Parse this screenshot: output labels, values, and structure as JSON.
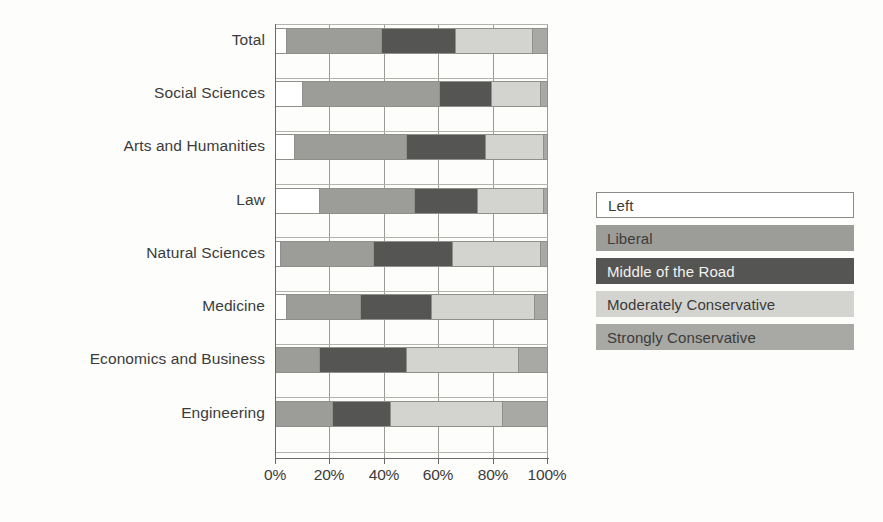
{
  "chart_data": {
    "type": "bar",
    "orientation": "horizontal",
    "stacked": true,
    "normalized": true,
    "title": "",
    "xlabel": "",
    "ylabel": "",
    "xlim": [
      0,
      100
    ],
    "xticks": [
      "0%",
      "20%",
      "40%",
      "60%",
      "80%",
      "100%"
    ],
    "xtick_values": [
      0,
      20,
      40,
      60,
      80,
      100
    ],
    "grid": true,
    "legend_position": "right",
    "categories": [
      "Total",
      "Social Sciences",
      "Arts and Humanities",
      "Law",
      "Natural Sciences",
      "Medicine",
      "Economics and Business",
      "Engineering"
    ],
    "series": [
      {
        "name": "Left",
        "color": "#ffffff",
        "values": [
          4,
          10,
          7,
          16,
          2,
          4,
          0,
          0
        ]
      },
      {
        "name": "Liberal",
        "color": "#9c9c99",
        "values": [
          35,
          50,
          41,
          35,
          34,
          27,
          16,
          21
        ]
      },
      {
        "name": "Middle of the Road",
        "color": "#555553",
        "values": [
          27,
          19,
          29,
          23,
          29,
          26,
          32,
          21
        ]
      },
      {
        "name": "Moderately Conservative",
        "color": "#d3d3d0",
        "values": [
          28,
          18,
          21,
          24,
          32,
          38,
          41,
          41
        ]
      },
      {
        "name": "Strongly Conservative",
        "color": "#a8a8a4",
        "values": [
          6,
          3,
          2,
          2,
          3,
          5,
          11,
          17
        ]
      }
    ],
    "cumulative_boundaries": [
      {
        "category": "Total",
        "stops": [
          4,
          39,
          66,
          94,
          100
        ]
      },
      {
        "category": "Social Sciences",
        "stops": [
          10,
          60,
          79,
          97,
          100
        ]
      },
      {
        "category": "Arts and Humanities",
        "stops": [
          7,
          48,
          77,
          98,
          100
        ]
      },
      {
        "category": "Law",
        "stops": [
          16,
          51,
          74,
          98,
          100
        ]
      },
      {
        "category": "Natural Sciences",
        "stops": [
          2,
          36,
          65,
          97,
          100
        ]
      },
      {
        "category": "Medicine",
        "stops": [
          4,
          31,
          57,
          95,
          100
        ]
      },
      {
        "category": "Economics and Business",
        "stops": [
          0,
          16,
          48,
          89,
          100
        ]
      },
      {
        "category": "Engineering",
        "stops": [
          0,
          21,
          42,
          83,
          100
        ]
      }
    ]
  },
  "legend": {
    "items": [
      {
        "label": "Left"
      },
      {
        "label": "Liberal"
      },
      {
        "label": "Middle of the Road"
      },
      {
        "label": "Moderately Conservative"
      },
      {
        "label": "Strongly Conservative"
      }
    ]
  }
}
